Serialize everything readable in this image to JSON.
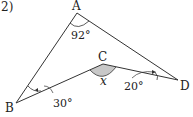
{
  "problem": {
    "number": "2)"
  },
  "figure": {
    "vertices": [
      {
        "name": "A",
        "x": 77,
        "y": 13
      },
      {
        "name": "B",
        "x": 16,
        "y": 103
      },
      {
        "name": "C",
        "x": 103,
        "y": 64
      },
      {
        "name": "D",
        "x": 178,
        "y": 80
      }
    ],
    "labels": {
      "A": "A",
      "B": "B",
      "C": "C",
      "D": "D"
    },
    "angles": {
      "A": "92°",
      "B": "30°",
      "D": "20°",
      "C": "x"
    },
    "colors": {
      "line": "#333333",
      "shade": "#c8c8c8"
    }
  }
}
